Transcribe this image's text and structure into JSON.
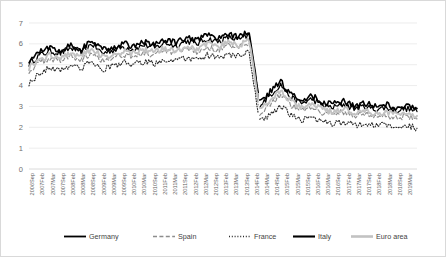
{
  "chart_data": {
    "type": "line",
    "title": "",
    "xlabel": "",
    "ylabel": "",
    "ylim": [
      0,
      7
    ],
    "yticks": [
      0,
      1,
      2,
      3,
      4,
      5,
      6,
      7
    ],
    "grid": true,
    "legend_position": "bottom",
    "categories": [
      "2006Sep",
      "2007Feb",
      "2007Mar",
      "2007Sep",
      "2008Feb",
      "2008Mar",
      "2008Sep",
      "2009Feb",
      "2009Mar",
      "2009Sep",
      "2010Feb",
      "2010Mar",
      "2010Sep",
      "2011Feb",
      "2011Mar",
      "2011Sep",
      "2012Feb",
      "2012Mar",
      "2012Sep",
      "2013Feb",
      "2013Mar",
      "2013Sep",
      "2014Feb",
      "2014Mar",
      "2014Sep",
      "2015Feb",
      "2015Mar",
      "2015Sep",
      "2016Feb",
      "2016Mar",
      "2016Sep",
      "2017Feb",
      "2017Mar",
      "2017Sep",
      "2018Feb",
      "2018Mar",
      "2018Sep",
      "2019Mar"
    ],
    "series": [
      {
        "name": "Germany",
        "style": "solid-black",
        "color": "#000000",
        "values": [
          5.05,
          5.45,
          5.65,
          5.55,
          5.8,
          5.6,
          6.0,
          5.55,
          5.7,
          5.85,
          5.75,
          5.95,
          5.8,
          6.05,
          5.9,
          6.15,
          6.0,
          6.25,
          6.1,
          6.3,
          6.2,
          6.4,
          3.05,
          3.55,
          4.05,
          3.4,
          3.15,
          3.35,
          3.05,
          2.95,
          3.1,
          2.9,
          3.0,
          2.85,
          2.95,
          2.8,
          2.9,
          2.75
        ]
      },
      {
        "name": "Spain",
        "style": "dashed-gray",
        "color": "#8d8d8d",
        "values": [
          4.7,
          5.1,
          5.3,
          5.2,
          5.45,
          5.25,
          5.6,
          5.2,
          5.35,
          5.5,
          5.4,
          5.55,
          5.45,
          5.65,
          5.55,
          5.75,
          5.6,
          5.85,
          5.7,
          5.9,
          5.8,
          6.0,
          2.7,
          3.15,
          3.6,
          3.05,
          2.8,
          3.0,
          2.7,
          2.6,
          2.75,
          2.55,
          2.65,
          2.5,
          2.6,
          2.45,
          2.55,
          2.4
        ]
      },
      {
        "name": "France",
        "style": "dotted-black",
        "color": "#2b2b2b",
        "values": [
          4.1,
          4.6,
          4.85,
          4.75,
          5.0,
          4.8,
          5.2,
          4.75,
          4.95,
          5.1,
          5.0,
          5.15,
          5.05,
          5.25,
          5.15,
          5.35,
          5.2,
          5.45,
          5.3,
          5.5,
          5.4,
          5.6,
          2.25,
          2.6,
          3.05,
          2.55,
          2.35,
          2.5,
          2.25,
          2.15,
          2.3,
          2.1,
          2.2,
          2.05,
          2.15,
          2.0,
          2.1,
          1.95
        ]
      },
      {
        "name": "Italy",
        "style": "thick-solid-black",
        "color": "#000000",
        "values": [
          5.2,
          5.6,
          5.85,
          5.7,
          5.95,
          5.75,
          6.15,
          5.7,
          5.85,
          6.0,
          5.9,
          6.1,
          5.95,
          6.2,
          6.05,
          6.3,
          6.15,
          6.4,
          6.25,
          6.45,
          6.35,
          6.55,
          3.2,
          3.7,
          4.2,
          3.55,
          3.3,
          3.5,
          3.2,
          3.1,
          3.25,
          3.05,
          3.15,
          3.0,
          3.1,
          2.95,
          3.05,
          2.9
        ]
      },
      {
        "name": "Euro area",
        "style": "thick-light-gray",
        "color": "#c2c2c2",
        "values": [
          4.85,
          5.25,
          5.45,
          5.35,
          5.6,
          5.4,
          5.8,
          5.35,
          5.5,
          5.65,
          5.55,
          5.7,
          5.6,
          5.8,
          5.7,
          5.9,
          5.75,
          6.0,
          5.85,
          6.05,
          5.95,
          6.15,
          2.85,
          3.3,
          3.75,
          3.2,
          2.95,
          3.15,
          2.85,
          2.75,
          2.9,
          2.7,
          2.8,
          2.65,
          2.75,
          2.6,
          2.7,
          2.55
        ]
      }
    ],
    "legend": [
      {
        "label": "Germany",
        "key": "germany"
      },
      {
        "label": "Spain",
        "key": "spain"
      },
      {
        "label": "France",
        "key": "france"
      },
      {
        "label": "Italy",
        "key": "italy"
      },
      {
        "label": "Euro area",
        "key": "euro"
      }
    ]
  },
  "plot_paths": {
    "germany": "M30,142 L33,116 L36,121 L39,107 L42,114 L45,99 L48,110 L51,95 L54,104 L57,88 L60,97 L63,84 L66,92 L69,80 L72,90 L75,79 L78,86 L81,74 L84,83 L87,71 L90,78 L93,67 L96,75 L99,64 L102,72 L105,62 L108,69 L111,60 L114,67 L117,58 L120,65 L123,56 L126,63 L129,54 L130,60 L131,125 L133,131 L136,122 L139,128 L142,118 L145,126 L148,115 L151,123 L154,113 L157,121 L160,112 L163,119 L166,110 L169,117 L172,109 L175,116 L178,108 L181,115 L184,107 L187,114 L190,106 L193,113 L196,105 L199,112 L202,104 L205,111 L208,103 L211,110 L214,102 L217,109 L220,101 L223,108 L226,100 L229,107 L232,99 L235,106 L238,98 L241,105 L244,97 L247,104 L250,96 L253,103 L256,95 L259,102 L262,94 L265,101 L268,93 L271,100 L274,92 L277,99 L280,91 L283,98 L286,90 L289,97 L292,89 L295,96 L298,88 L301,95 L304,87 L307,94 L310,86 L313,93 L316,85 L319,92 L322,84 L325,91 L328,83 L331,90 L334,82 L337,89 L340,81 L343,88 L346,80 L349,87 L352,79 L355,86 L358,78 L361,85 L364,77 L367,84 L370,76 L373,83 L376,75 L379,82 L382,74 L385,81 L388,73 L391,80 L394,72 L397,79 L400,71 L403,78 L406,70 L409,77 L412,69 L415,76",
    "spain": "",
    "france": "",
    "italy": "",
    "euro": ""
  }
}
